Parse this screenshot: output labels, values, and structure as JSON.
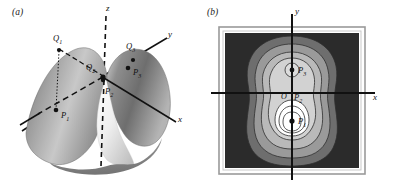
{
  "figure": {
    "panels": [
      {
        "tag": "(a)",
        "name": "surface-plot",
        "type": "3d-surface",
        "description": "Two-peaked saddle surface with coordinate axes",
        "axes": [
          {
            "id": "x",
            "label": "x"
          },
          {
            "id": "y",
            "label": "y"
          },
          {
            "id": "z",
            "label": "z",
            "style": "dashed"
          }
        ],
        "points": [
          {
            "id": "Q1",
            "label": "Q",
            "sub": "1"
          },
          {
            "id": "Q2",
            "label": "Q",
            "sub": "2"
          },
          {
            "id": "Q3",
            "label": "Q",
            "sub": "3"
          },
          {
            "id": "P1",
            "label": "P",
            "sub": "1"
          },
          {
            "id": "P2",
            "label": "P",
            "sub": "2"
          },
          {
            "id": "P3",
            "label": "P",
            "sub": "3"
          }
        ]
      },
      {
        "tag": "(b)",
        "name": "contour-plot",
        "type": "contour-map",
        "description": "Level curves of the surface in the xy-plane",
        "axes": [
          {
            "id": "x",
            "label": "x"
          },
          {
            "id": "y",
            "label": "y"
          }
        ],
        "origin": {
          "id": "O",
          "label": "O"
        },
        "points": [
          {
            "id": "P1",
            "label": "P",
            "sub": "1"
          },
          {
            "id": "P2",
            "label": "P",
            "sub": "2"
          },
          {
            "id": "P3",
            "label": "P",
            "sub": "3"
          }
        ],
        "shading": {
          "outer": "#2b2b2b",
          "band2": "#6e6e6e",
          "band3": "#9a9a9a",
          "band4": "#b9b9b9",
          "band5": "#d2d2d2",
          "band6": "#e6e6e6",
          "inner": "#ffffff"
        }
      }
    ],
    "colors": {
      "ink": "#111111",
      "surface_light": "#e8e8e8",
      "surface_mid": "#9c9c9c",
      "surface_dark": "#5a5a5a",
      "frame": "#8a8a8a"
    }
  }
}
